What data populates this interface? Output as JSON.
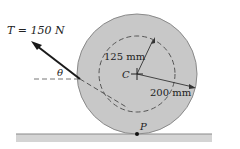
{
  "diagram": {
    "tension_label": "T = 150 N",
    "angle_label": "θ",
    "inner_radius_label": "125 mm",
    "outer_radius_label": "200 mm",
    "center_label": "C",
    "contact_label": "P",
    "colors": {
      "disk_fill": "#c8c8c8",
      "disk_stroke": "#8a8a8a",
      "ground": "#a8a8a8",
      "arrow": "#1a1a1a",
      "dashed": "#555555"
    }
  }
}
